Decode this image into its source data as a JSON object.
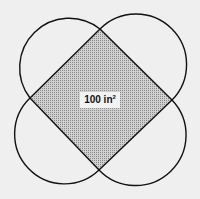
{
  "figure": {
    "label_value": "100 in",
    "label_exponent": "2",
    "fill_color": "#b8b8b8",
    "stroke_color": "#111111",
    "background": "#efefef"
  }
}
